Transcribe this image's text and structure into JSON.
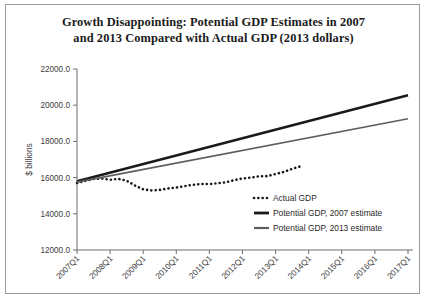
{
  "figure": {
    "title_line1": "Growth Disappointing: Potential GDP Estimates in 2007",
    "title_line2": "and 2013 Compared with Actual GDP (2013 dollars)"
  },
  "chart_data": {
    "type": "line",
    "title": "Growth Disappointing: Potential GDP Estimates in 2007 and 2013 Compared with Actual GDP (2013 dollars)",
    "xlabel": "",
    "ylabel": "$ billions",
    "ylim": [
      12000.0,
      22000.0
    ],
    "ytick_values": [
      12000.0,
      14000.0,
      16000.0,
      18000.0,
      20000.0,
      22000.0
    ],
    "ytick_labels": [
      "12000.0",
      "14000.0",
      "16000.0",
      "18000.0",
      "20000.0",
      "22000.0"
    ],
    "xlim": [
      "2007Q1",
      "2017Q1"
    ],
    "xtick_labels": [
      "2007Q1",
      "2008Q1",
      "2009Q1",
      "2010Q1",
      "2011Q1",
      "2012Q1",
      "2013Q1",
      "2014Q1",
      "2015Q1",
      "2016Q1",
      "2017Q1"
    ],
    "grid": false,
    "legend_position": "center-right-inside",
    "x_quarters": [
      "2007Q1",
      "2007Q2",
      "2007Q3",
      "2007Q4",
      "2008Q1",
      "2008Q2",
      "2008Q3",
      "2008Q4",
      "2009Q1",
      "2009Q2",
      "2009Q3",
      "2009Q4",
      "2010Q1",
      "2010Q2",
      "2010Q3",
      "2010Q4",
      "2011Q1",
      "2011Q2",
      "2011Q3",
      "2011Q4",
      "2012Q1",
      "2012Q2",
      "2012Q3",
      "2012Q4",
      "2013Q1",
      "2013Q2",
      "2013Q3",
      "2013Q4",
      "2014Q1",
      "2014Q2",
      "2014Q3",
      "2014Q4",
      "2015Q1",
      "2015Q2",
      "2015Q3",
      "2015Q4",
      "2016Q1",
      "2016Q2",
      "2016Q3",
      "2016Q4",
      "2017Q1"
    ],
    "series": [
      {
        "name": "Actual GDP",
        "style": "dotted",
        "color": "#1a1a1a",
        "x": [
          "2007Q1",
          "2007Q2",
          "2007Q3",
          "2007Q4",
          "2008Q1",
          "2008Q2",
          "2008Q3",
          "2008Q4",
          "2009Q1",
          "2009Q2",
          "2009Q3",
          "2009Q4",
          "2010Q1",
          "2010Q2",
          "2010Q3",
          "2010Q4",
          "2011Q1",
          "2011Q2",
          "2011Q3",
          "2011Q4",
          "2012Q1",
          "2012Q2",
          "2012Q3",
          "2012Q4",
          "2013Q1",
          "2013Q2",
          "2013Q3",
          "2013Q4"
        ],
        "values": [
          15700,
          15820,
          15920,
          15950,
          15880,
          15930,
          15830,
          15560,
          15350,
          15290,
          15320,
          15400,
          15450,
          15530,
          15600,
          15650,
          15640,
          15690,
          15740,
          15860,
          15950,
          16000,
          16070,
          16080,
          16200,
          16320,
          16480,
          16620
        ]
      },
      {
        "name": "Potential GDP, 2007 estimate",
        "style": "solid-thick",
        "color": "#1a1a1a",
        "x": [
          "2007Q1",
          "2017Q1"
        ],
        "values": [
          15800,
          20550
        ]
      },
      {
        "name": "Potential GDP, 2013 estimate",
        "style": "solid-medium",
        "color": "#5e5e5e",
        "x": [
          "2007Q1",
          "2017Q1"
        ],
        "values": [
          15750,
          19250
        ]
      }
    ],
    "legend": [
      {
        "label": "Actual GDP",
        "style": "dotted",
        "color": "#1a1a1a"
      },
      {
        "label": "Potential GDP, 2007 estimate",
        "style": "solid-thick",
        "color": "#1a1a1a"
      },
      {
        "label": "Potential GDP, 2013 estimate",
        "style": "solid-medium",
        "color": "#5e5e5e"
      }
    ]
  }
}
